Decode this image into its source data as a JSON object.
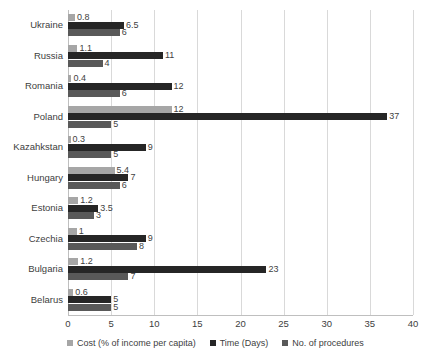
{
  "chart_data": {
    "type": "bar",
    "orientation": "horizontal",
    "title": "",
    "subtitle": "",
    "xlabel": "",
    "ylabel": "",
    "xlim": [
      0,
      40
    ],
    "xticks": [
      0,
      5,
      10,
      15,
      20,
      25,
      30,
      35,
      40
    ],
    "grid": "vertical",
    "legend_position": "bottom",
    "categories": [
      "Ukraine",
      "Russia",
      "Romania",
      "Poland",
      "Kazahkstan",
      "Hungary",
      "Estonia",
      "Czechia",
      "Bulgaria",
      "Belarus"
    ],
    "series": [
      {
        "name": "Cost (% of income per capita)",
        "color": "#a6a6a6",
        "values": [
          0.8,
          1.1,
          0.4,
          12,
          0.3,
          5.4,
          1.2,
          1,
          1.2,
          0.6
        ],
        "labels": [
          "0.8",
          "1.1",
          "0.4",
          "12",
          "0.3",
          "5.4",
          "1.2",
          "1",
          "1.2",
          "0.6"
        ]
      },
      {
        "name": "Time (Days)",
        "color": "#262626",
        "values": [
          6.5,
          11,
          12,
          37,
          9,
          7,
          3.5,
          9,
          23,
          5
        ],
        "labels": [
          "6.5",
          "11",
          "12",
          "37",
          "9",
          "7",
          "3.5",
          "9",
          "23",
          "5"
        ]
      },
      {
        "name": "No. of procedures",
        "color": "#595959",
        "values": [
          6,
          4,
          6,
          5,
          5,
          6,
          3,
          8,
          7,
          5
        ],
        "labels": [
          "6",
          "4",
          "6",
          "5",
          "5",
          "6",
          "3",
          "8",
          "7",
          "5"
        ]
      }
    ]
  },
  "legend": {
    "items": [
      {
        "label": "Cost (% of income per capita)",
        "color": "#a6a6a6"
      },
      {
        "label": "Time (Days)",
        "color": "#262626"
      },
      {
        "label": "No. of procedures",
        "color": "#595959"
      }
    ]
  }
}
